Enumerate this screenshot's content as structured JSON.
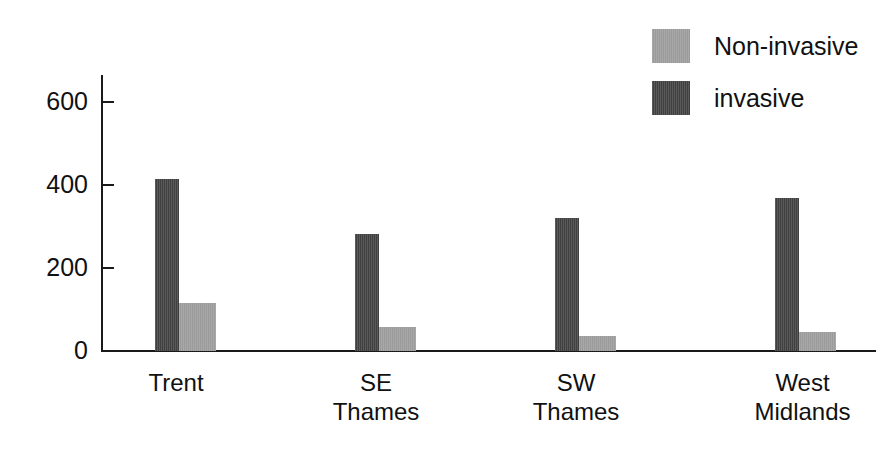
{
  "chart_data": {
    "type": "bar",
    "title": "",
    "subtitle": "",
    "xlabel": "",
    "ylabel": "",
    "categories": [
      "Trent",
      "SE\nThames",
      "SW\nThames",
      "West\nMidlands"
    ],
    "series": [
      {
        "name": "Non-invasive",
        "color": "#a2a2a2",
        "values": [
          116,
          58,
          36,
          46
        ]
      },
      {
        "name": "invasive",
        "color": "#474747",
        "values": [
          415,
          282,
          320,
          369
        ]
      }
    ],
    "ylim": [
      0,
      650
    ],
    "yticks": [
      0,
      200,
      400,
      600
    ],
    "ytick_labels": [
      "0",
      "200",
      "400",
      "600"
    ],
    "grid": false,
    "legend_position": "top-right",
    "legend_entries": [
      {
        "label": "Non-invasive",
        "color": "#a2a2a2"
      },
      {
        "label": "invasive",
        "color": "#474747"
      }
    ],
    "annotations": []
  },
  "legend": {
    "entries": [
      {
        "label": "Non-invasive",
        "swatch_class": "sw-noninvasive"
      },
      {
        "label": "invasive",
        "swatch_class": "sw-invasive"
      }
    ]
  },
  "axis": {
    "y_tick_labels": [
      "600",
      "400",
      "200",
      "0"
    ]
  },
  "categories": {
    "items": [
      "Trent",
      "SE\nThames",
      "SW\nThames",
      "West\nMidlands"
    ]
  }
}
